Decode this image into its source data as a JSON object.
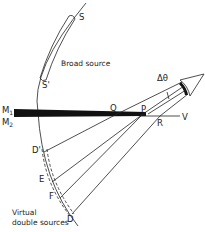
{
  "figure": {
    "labels": {
      "S": "S",
      "S_prime": "S'",
      "broad_source": "Broad source",
      "M1": "M",
      "M1_sub": "1",
      "M2": "M",
      "M2_sub": "2",
      "Q": "Q",
      "P": "P",
      "R": "R",
      "V": "V",
      "delta_theta": "Δθ",
      "D_prime": "D'",
      "E": "E",
      "F": "F",
      "D": "D",
      "virtual_line1": "Virtual",
      "virtual_line2": "double sources"
    },
    "colors": {
      "ink": "#222222",
      "background": "#ffffff"
    }
  }
}
